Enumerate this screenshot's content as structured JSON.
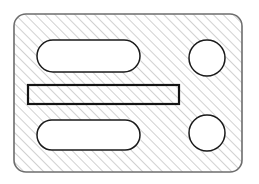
{
  "figure": {
    "type": "engineering-section-drawing",
    "canvas": {
      "width": 259,
      "height": 184,
      "background": "#ffffff"
    }
  },
  "style": {
    "hatch_color": "#9a9a9a",
    "hatch_angle_deg": 45,
    "hatch_spacing_px": 7,
    "hatch_stroke_width": 0.9,
    "body_outline_color": "#6d6d6d",
    "body_outline_width": 1.6,
    "body_fill": "#ffffff",
    "feature_outline_color": "#1a1a1a",
    "feature_outline_width": 1.5,
    "feature_fill": "#ffffff",
    "rib_outline_color": "#141414",
    "rib_outline_width": 2.2
  },
  "body": {
    "name": "hatched-plate-body",
    "shape": "rounded-rectangle",
    "x": 14,
    "y": 14,
    "width": 228,
    "height": 158,
    "corner_radius": 12,
    "hatched": true
  },
  "features": [
    {
      "id": "upper-slot",
      "name": "upper-obround-slot",
      "shape": "stadium",
      "x": 37,
      "y": 40,
      "width": 103,
      "height": 32,
      "corner_radius": 16,
      "hatched": false
    },
    {
      "id": "center-rib",
      "name": "center-rectangular-rib",
      "shape": "rectangle",
      "x": 28,
      "y": 85,
      "width": 151,
      "height": 19,
      "corner_radius": 0,
      "hatched": true
    },
    {
      "id": "lower-slot",
      "name": "lower-obround-slot",
      "shape": "stadium",
      "x": 37,
      "y": 120,
      "width": 103,
      "height": 30,
      "corner_radius": 15,
      "hatched": false
    },
    {
      "id": "upper-bore",
      "name": "upper-circular-bore",
      "shape": "circle",
      "cx": 207,
      "cy": 58,
      "r": 18,
      "hatched": false
    },
    {
      "id": "lower-bore",
      "name": "lower-circular-bore",
      "shape": "circle",
      "cx": 207,
      "cy": 133,
      "r": 18,
      "hatched": false
    }
  ]
}
